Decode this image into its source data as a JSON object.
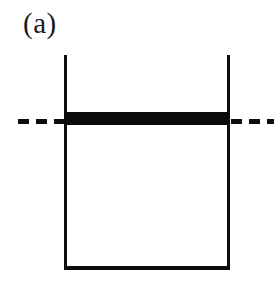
{
  "figure": {
    "panel_label": "(a)",
    "type": "schematic-diagram",
    "background_color": "#ffffff",
    "ink_color": "#0d0d0d"
  },
  "container": {
    "name": "open-top-well",
    "left_wall": {
      "label": ""
    },
    "right_wall": {
      "label": ""
    },
    "bottom_wall": {
      "label": ""
    }
  },
  "level_bar": {
    "label": "",
    "color": "#0a0a0a"
  },
  "reference_line": {
    "label": "",
    "style": "dashed",
    "color": "#0d0d0d",
    "left_dashes": [
      "",
      "",
      ""
    ],
    "right_dashes": [
      "",
      "",
      ""
    ]
  }
}
